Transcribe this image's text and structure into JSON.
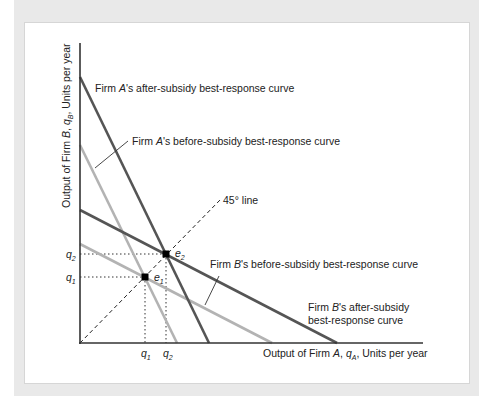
{
  "diagram": {
    "type": "best-response diagram",
    "axes": {
      "x_label": {
        "pre": "Output of Firm ",
        "firm": "A",
        "sep": ", ",
        "var": "q",
        "sub": "A",
        "post": ", Units per year"
      },
      "y_label": {
        "pre": "Output of Firm ",
        "firm": "B",
        "sep": ", ",
        "var": "q",
        "sub": "B",
        "post": ", Units per year"
      },
      "x_ticks": [
        {
          "var": "q",
          "sub": "1"
        },
        {
          "var": "q",
          "sub": "2"
        }
      ],
      "y_ticks": [
        {
          "var": "q",
          "sub": "2"
        },
        {
          "var": "q",
          "sub": "1"
        }
      ]
    },
    "curves": {
      "a_after": {
        "pre": "Firm ",
        "firm": "A",
        "post": "'s after-subsidy best-response curve",
        "color": "#555555"
      },
      "a_before": {
        "pre": "Firm ",
        "firm": "A",
        "post": "'s before-subsidy best-response curve",
        "color": "#b3b3b3"
      },
      "b_before": {
        "pre": "Firm ",
        "firm": "B",
        "post": "'s before-subsidy best-response curve",
        "color": "#b3b3b3"
      },
      "b_after": {
        "pre": "Firm ",
        "firm": "B",
        "post": "'s after-subsidy",
        "line2": "best-response curve",
        "color": "#555555"
      },
      "diag": {
        "label": "45° line"
      }
    },
    "equilibria": [
      {
        "var": "e",
        "sub": "1"
      },
      {
        "var": "e",
        "sub": "2"
      }
    ]
  }
}
